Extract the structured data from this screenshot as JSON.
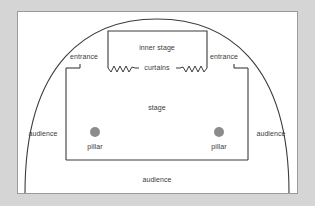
{
  "diagram": {
    "colors": {
      "background": "#d5d5d5",
      "panel": "#ffffff",
      "panel_border": "#9a9a9a",
      "line": "#3b3b3b",
      "pillar_fill": "#8c8c8c",
      "text": "#3b3b3b"
    },
    "labels": {
      "inner_stage": "inner stage",
      "curtains": "curtains",
      "stage": "stage",
      "entrance_left": "entrance",
      "entrance_right": "entrance",
      "pillar_left": "pillar",
      "pillar_right": "pillar",
      "audience_left": "audience",
      "audience_right": "audience",
      "audience_bottom": "audience"
    },
    "shapes": {
      "arc": "semicircular-audience-boundary",
      "stage_rect": "main-stage-rectangle",
      "inner_stage_rect": "inner-stage-rectangle",
      "curtain_line": "zigzag-curtain",
      "pillar_shape": "filled-circle"
    }
  }
}
